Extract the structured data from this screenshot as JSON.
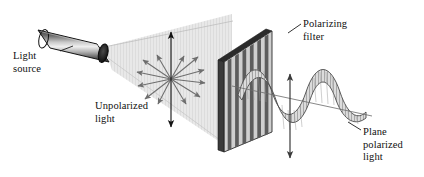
{
  "figure": {
    "background_color": "#ffffff",
    "width": 424,
    "height": 177
  },
  "labels": {
    "light_source": "Light\nsource",
    "unpolarized": "Unpolarized\nlight",
    "polarizing_filter": "Polarizing\nfilter",
    "plane_polarized": "Plane\npolarized\nlight"
  },
  "elements": {
    "light_source_lamp": {
      "name": "cylindrical lamp",
      "fill_light": "#f2f2f2",
      "fill_dark": "#4a4a4a",
      "outline": "#1a1a1a"
    },
    "light_beam_cone": {
      "name": "unpolarized light cone",
      "fill": "#e4e4e4",
      "hatch": "#d2d2d2"
    },
    "unpolarized_arrow_star": {
      "name": "radial vibration arrows",
      "arrow_count": 12,
      "arrow_color": "#6e6e6e",
      "vertical_axis_color": "#111111"
    },
    "polarizing_filter": {
      "name": "striped polarizing filter plate",
      "stripe_dark": "#5c5c5c",
      "stripe_light": "#cfcfcf",
      "edge_color": "#2b2b2b",
      "stripe_count": 13
    },
    "plane_polarized_wave": {
      "name": "sine wave of plane polarized light",
      "fill": "#d8d8d8",
      "hatch": "#9a9a9a",
      "outline": "#4a4a4a",
      "cycles": 2
    },
    "polarization_axis_arrow": {
      "name": "vertical double headed arrow",
      "color": "#3a3a3a"
    },
    "leader_lines": {
      "color": "#202020"
    }
  },
  "colors": {
    "ink": "#101010",
    "gray_mid": "#808080",
    "gray_light": "#e4e4e4"
  }
}
